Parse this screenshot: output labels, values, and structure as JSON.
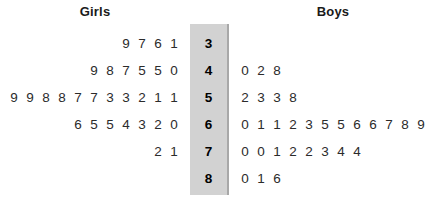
{
  "headers": {
    "left": "Girls",
    "right": "Boys"
  },
  "colors": {
    "stem_band_fill": "#d2d2d2",
    "stem_band_border": "#a8a8a8",
    "text": "#231f20",
    "background": "#ffffff"
  },
  "chart_data": {
    "type": "table",
    "subtype": "back-to-back stem-and-leaf plot",
    "left_label": "Girls",
    "right_label": "Boys",
    "stem_label": "",
    "stems": [
      "3",
      "4",
      "5",
      "6",
      "7",
      "8"
    ],
    "rows": [
      {
        "stem": "3",
        "left_leaves": [
          "9",
          "7",
          "6",
          "1"
        ],
        "right_leaves": []
      },
      {
        "stem": "4",
        "left_leaves": [
          "9",
          "8",
          "7",
          "5",
          "5",
          "0"
        ],
        "right_leaves": [
          "0",
          "2",
          "8"
        ]
      },
      {
        "stem": "5",
        "left_leaves": [
          "9",
          "9",
          "8",
          "8",
          "7",
          "7",
          "3",
          "3",
          "2",
          "1",
          "1"
        ],
        "right_leaves": [
          "2",
          "3",
          "3",
          "8"
        ]
      },
      {
        "stem": "6",
        "left_leaves": [
          "6",
          "5",
          "5",
          "4",
          "3",
          "2",
          "0"
        ],
        "right_leaves": [
          "0",
          "1",
          "1",
          "2",
          "3",
          "5",
          "5",
          "6",
          "6",
          "7",
          "8",
          "9"
        ]
      },
      {
        "stem": "7",
        "left_leaves": [
          "2",
          "1"
        ],
        "right_leaves": [
          "0",
          "0",
          "1",
          "2",
          "2",
          "3",
          "4",
          "4"
        ]
      },
      {
        "stem": "8",
        "left_leaves": [],
        "right_leaves": [
          "0",
          "1",
          "6"
        ]
      }
    ],
    "left_values": [
      31,
      36,
      37,
      39,
      40,
      45,
      45,
      47,
      48,
      49,
      51,
      51,
      52,
      53,
      53,
      57,
      57,
      58,
      58,
      59,
      59,
      60,
      62,
      63,
      64,
      65,
      65,
      66,
      71,
      72
    ],
    "right_values": [
      40,
      42,
      48,
      52,
      53,
      53,
      58,
      60,
      61,
      61,
      62,
      63,
      65,
      65,
      66,
      66,
      67,
      68,
      69,
      70,
      70,
      71,
      72,
      72,
      73,
      74,
      74,
      80,
      81,
      86
    ],
    "left_count": 30,
    "right_count": 30
  }
}
